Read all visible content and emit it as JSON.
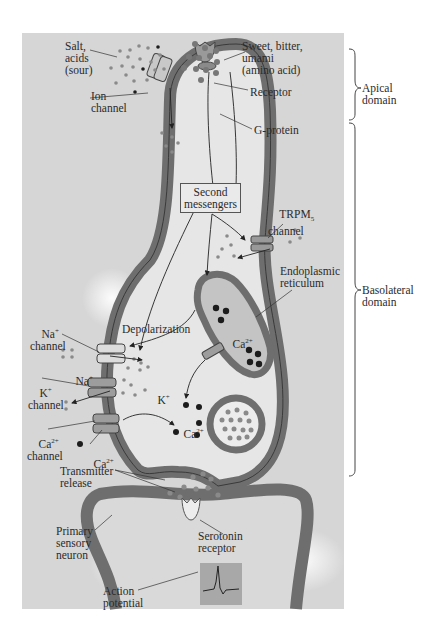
{
  "figure": {
    "colors": {
      "panel_bg": "#d6d6d6",
      "cell_interior": "#e6e6e6",
      "membrane": "#6e6e6e",
      "membrane_outline": "#3a3a3a",
      "er_interior": "#c4c4c4",
      "ion_dark": "#1c1c1c",
      "ion_gray": "#8a8a8a",
      "background": "#ffffff"
    },
    "labels": {
      "salt_acids": "Salt,\nacids\n(sour)",
      "sweet_bitter": "Sweet, bitter,\numami\n(amino acid)",
      "ion_channel": "Ion\nchannel",
      "receptor": "Receptor",
      "g_protein": "G-protein",
      "second_messengers": "Second\nmessengers",
      "trpm5_channel_main": "TRPM",
      "trpm5_channel_sub": "5",
      "trpm5_channel_word": "channel",
      "endoplasmic_reticulum": "Endoplasmic\nreticulum",
      "na_channel_ion": "Na",
      "na_channel_charge": "+",
      "na_channel_word": "channel",
      "na_ion": "Na",
      "na_ion_charge": "+",
      "depolarization": "Depolarization",
      "k_channel_ion": "K",
      "k_channel_charge": "+",
      "k_channel_word": "channel",
      "k_ion": "K",
      "k_ion_charge": "+",
      "ca_er": "Ca",
      "ca_er_charge": "2+",
      "ca_cyto": "Ca",
      "ca_cyto_charge": "2+",
      "ca_channel_ion": "Ca",
      "ca_channel_charge": "2+",
      "ca_channel_word": "channel",
      "ca_outside": "Ca",
      "ca_outside_charge": "2+",
      "transmitter_release": "Transmitter\nrelease",
      "primary_sensory_neuron": "Primary\nsensory\nneuron",
      "serotonin_receptor": "Serotonin\nreceptor",
      "action_potential": "Action\npotential"
    },
    "domains": [
      {
        "label": "Apical\ndomain"
      },
      {
        "label": "Basolateral\ndomain"
      }
    ]
  }
}
